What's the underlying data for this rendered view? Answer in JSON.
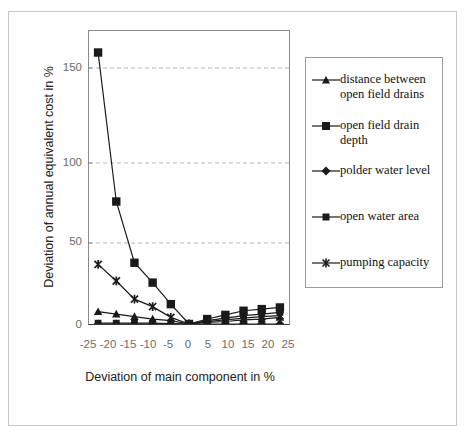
{
  "chart_data": {
    "type": "line",
    "title": "",
    "xlabel": "Deviation of main component in %",
    "ylabel": "Deviation of annual equivalent cost in %",
    "x": [
      -25,
      -20,
      -15,
      -10,
      -5,
      0,
      5,
      10,
      15,
      20,
      25
    ],
    "xticklabels": [
      "-25",
      "-20",
      "-15",
      "-10",
      "-5",
      "0",
      "5",
      "10",
      "15",
      "20",
      "25"
    ],
    "yticklabels": [
      "0",
      "50",
      "100",
      "150"
    ],
    "yticks": [
      0,
      50,
      100,
      150
    ],
    "xlim": [
      -27.5,
      27.5
    ],
    "ylim": [
      0,
      177
    ],
    "grid": "horizontal-dashed",
    "legend_position": "right-outside",
    "series": [
      {
        "name": "distance between\nopen field drains",
        "marker": "triangle",
        "values": [
          7.5,
          6,
          4.5,
          3,
          2,
          0,
          1,
          1.5,
          2.5,
          3,
          4
        ]
      },
      {
        "name": "open field drain\ndepth",
        "marker": "square",
        "values": [
          164,
          74,
          37,
          25,
          12,
          0,
          3,
          5.5,
          8,
          9,
          10
        ]
      },
      {
        "name": "polder water level",
        "marker": "diamond",
        "values": [
          0,
          0,
          0,
          0,
          0,
          0,
          0,
          0,
          0,
          0,
          0
        ]
      },
      {
        "name": "open water area",
        "marker": "square-small",
        "values": [
          0.5,
          0.5,
          0.5,
          0.5,
          0.3,
          0,
          2,
          3.5,
          5,
          6,
          7
        ]
      },
      {
        "name": "pumping capacity",
        "marker": "asterisk",
        "values": [
          36,
          26,
          15,
          10.5,
          4,
          0,
          1.5,
          2.5,
          3.5,
          4.5,
          5
        ]
      }
    ]
  },
  "legend": {
    "items": [
      {
        "label": "distance between\nopen field drains",
        "marker": "triangle"
      },
      {
        "label": "open field drain\ndepth",
        "marker": "square"
      },
      {
        "label": "polder water level",
        "marker": "diamond"
      },
      {
        "label": "open water area",
        "marker": "square-small"
      },
      {
        "label": "pumping capacity",
        "marker": "asterisk"
      }
    ]
  },
  "colors": {
    "series": "#1a1a1a",
    "axis": "#7d7d7d",
    "grid": "#b5b5b5",
    "tick_text": "#6b6b6b",
    "title_text": "#222222",
    "frame": "#c8c8c8",
    "background": "#ffffff"
  }
}
